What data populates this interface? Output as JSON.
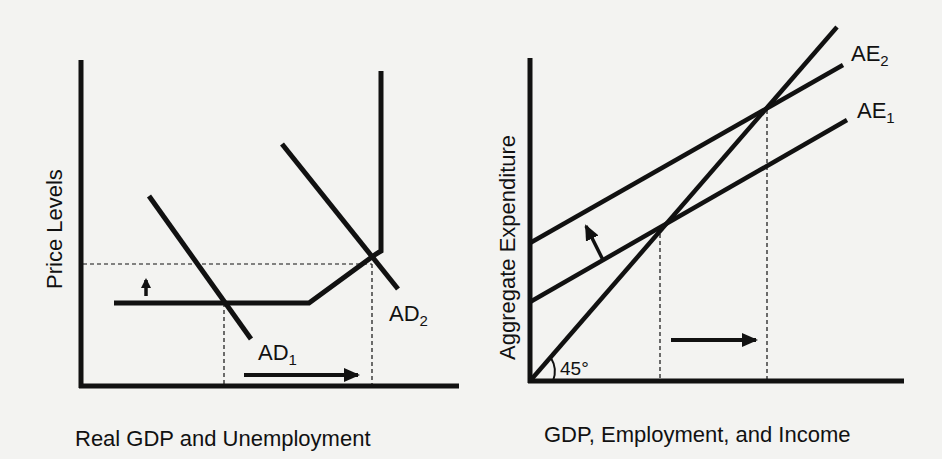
{
  "left_panel": {
    "x_axis_label": "Real GDP and Unemployment",
    "y_axis_label": "Price Levels",
    "curves": [
      {
        "id": "AS",
        "label": "",
        "points": [
          [
            114,
            303
          ],
          [
            309,
            303
          ],
          [
            376,
            254
          ],
          [
            381,
            71
          ]
        ]
      },
      {
        "id": "AD1",
        "label": "AD",
        "subscript": "1",
        "points": [
          [
            149,
            196
          ],
          [
            251,
            339
          ]
        ]
      },
      {
        "id": "AD2",
        "label": "AD",
        "subscript": "2",
        "points": [
          [
            282,
            144
          ],
          [
            398,
            289
          ]
        ]
      }
    ],
    "arrows": [
      {
        "direction": "up",
        "meaning": "price level rises"
      },
      {
        "direction": "right",
        "meaning": "real GDP increases"
      }
    ]
  },
  "right_panel": {
    "x_axis_label": "GDP, Employment, and Income",
    "y_axis_label": "Aggregate Expenditure",
    "angle_label": "45°",
    "curves": [
      {
        "id": "45-degree-line",
        "label": "",
        "points": [
          [
            530,
            381
          ],
          [
            837,
            27
          ]
        ]
      },
      {
        "id": "AE2",
        "label": "AE",
        "subscript": "2",
        "points": [
          [
            530,
            243
          ],
          [
            843,
            65
          ]
        ]
      },
      {
        "id": "AE1",
        "label": "AE",
        "subscript": "1",
        "points": [
          [
            530,
            302
          ],
          [
            847,
            120
          ]
        ]
      }
    ],
    "arrows": [
      {
        "direction": "up-left",
        "meaning": "AE shifts up"
      },
      {
        "direction": "right",
        "meaning": "equilibrium output increases"
      }
    ]
  },
  "colors": {
    "background": "#f3f3f1",
    "ink": "#111111"
  }
}
